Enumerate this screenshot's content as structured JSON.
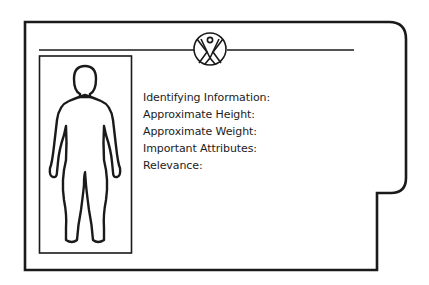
{
  "card": {
    "stroke_color": "#1a1a1a",
    "background": "#ffffff",
    "emblem": "person-in-circle-logo",
    "figure": "human-body-outline"
  },
  "fields": [
    {
      "label": "Identifying Information:"
    },
    {
      "label": "Approximate Height:"
    },
    {
      "label": "Approximate Weight:"
    },
    {
      "label": "Important Attributes:"
    },
    {
      "label": "Relevance:"
    }
  ]
}
